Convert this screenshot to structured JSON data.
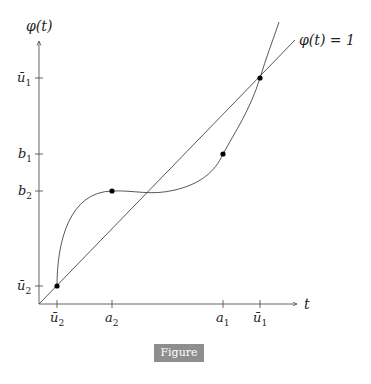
{
  "figure": {
    "caption": "Figure 6.3",
    "y_axis_label": "φ(t)",
    "x_axis_label": "t",
    "diagonal_label": "φ(t) = 1",
    "x_ticks": [
      {
        "base": "ū",
        "sub": "2"
      },
      {
        "base": "a",
        "sub": "2"
      },
      {
        "base": "a",
        "sub": "1"
      },
      {
        "base": "ū",
        "sub": "1"
      }
    ],
    "y_ticks": [
      {
        "base": "ū",
        "sub": "1"
      },
      {
        "base": "b",
        "sub": "1"
      },
      {
        "base": "b",
        "sub": "2"
      },
      {
        "base": "ū",
        "sub": "2"
      }
    ],
    "points": [
      {
        "name": "(ū2, ū2)"
      },
      {
        "name": "(a2, b2)"
      },
      {
        "name": "(a1, b1)"
      },
      {
        "name": "(ū1, ū1)"
      }
    ],
    "colors": {
      "axis": "#555555",
      "curve": "#444444",
      "point": "#000000",
      "caption_bg": "#8e8e8e"
    }
  }
}
